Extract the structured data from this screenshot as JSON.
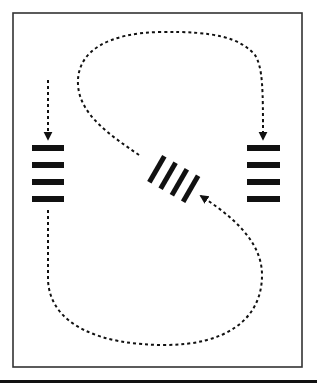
{
  "diagram": {
    "colors": {
      "ink": "#111111",
      "background": "#ffffff",
      "frame": "#333333"
    },
    "frame": {
      "x": 13,
      "y": 13,
      "width": 289,
      "height": 354
    },
    "bottom_rule": {
      "y": 381,
      "thickness": 3
    },
    "stacks": [
      {
        "name": "left-stack",
        "bar_count": 4,
        "orientation": "horizontal"
      },
      {
        "name": "center-stack",
        "bar_count": 4,
        "orientation": "diagonal"
      },
      {
        "name": "right-stack",
        "bar_count": 4,
        "orientation": "horizontal"
      }
    ],
    "arrows": [
      {
        "name": "left-incoming-arrow",
        "from": "top",
        "to": "left-stack",
        "style": "dashed"
      },
      {
        "name": "upper-loop-arrow",
        "from": "center-stack",
        "to": "right-stack",
        "style": "dashed"
      },
      {
        "name": "lower-loop-arrow",
        "from": "left-stack",
        "to": "center-stack",
        "style": "dashed"
      }
    ]
  }
}
